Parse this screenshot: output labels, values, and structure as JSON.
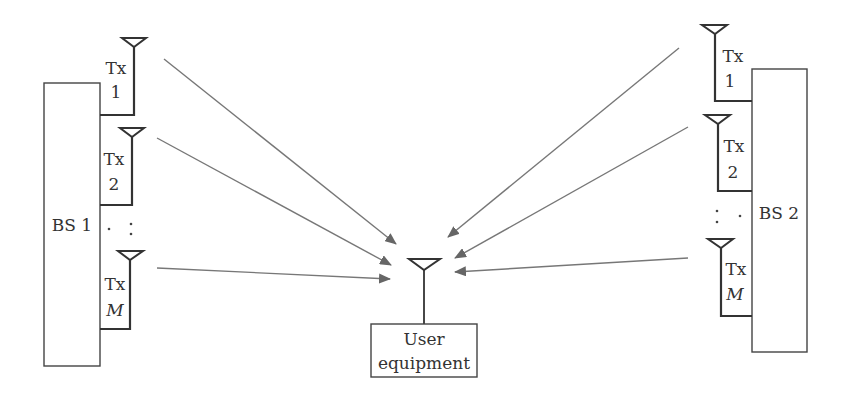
{
  "diagram": {
    "colors": {
      "line": "#333333",
      "arrow": "#777777",
      "background": "#ffffff"
    },
    "bs1": {
      "label": "BS 1",
      "antennas": [
        {
          "tx": "Tx",
          "index": "1"
        },
        {
          "tx": "Tx",
          "index": "2"
        },
        {
          "tx": "Tx",
          "index": "M"
        }
      ],
      "ellipsis": ". :"
    },
    "bs2": {
      "label": "BS 2",
      "antennas": [
        {
          "tx": "Tx",
          "index": "1"
        },
        {
          "tx": "Tx",
          "index": "2"
        },
        {
          "tx": "Tx",
          "index": "M"
        }
      ],
      "ellipsis": ": ."
    },
    "ue": {
      "line1": "User",
      "line2": "equipment"
    }
  }
}
